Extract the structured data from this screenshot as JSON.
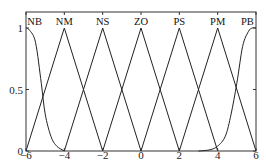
{
  "chart_data": {
    "type": "line",
    "title": "",
    "xlabel": "",
    "ylabel": "",
    "xlim": [
      -6,
      6
    ],
    "ylim": [
      0,
      1.1
    ],
    "x_ticks": [
      -6,
      -4,
      -2,
      0,
      2,
      4,
      6
    ],
    "x_tick_labels": [
      "−6",
      "−4",
      "−2",
      "0",
      "2",
      "4",
      "6"
    ],
    "y_ticks": [
      0,
      0.5,
      1
    ],
    "y_tick_labels": [
      "0",
      "0.5",
      "1"
    ],
    "grid": false,
    "legend": "none",
    "series": [
      {
        "name": "NB",
        "shape": "zmf",
        "params": [
          -6,
          -4
        ],
        "points": [
          [
            -6,
            1
          ],
          [
            -5.8,
            0.98
          ],
          [
            -5.5,
            0.88
          ],
          [
            -5.2,
            0.55
          ],
          [
            -5,
            0.3
          ],
          [
            -4.7,
            0.12
          ],
          [
            -4.4,
            0.04
          ],
          [
            -4,
            0
          ]
        ]
      },
      {
        "name": "NM",
        "shape": "trimf",
        "params": [
          -6,
          -4,
          -2
        ],
        "points": [
          [
            -6,
            0
          ],
          [
            -4,
            1
          ],
          [
            -2,
            0
          ]
        ]
      },
      {
        "name": "NS",
        "shape": "trimf",
        "params": [
          -4,
          -2,
          0
        ],
        "points": [
          [
            -4,
            0
          ],
          [
            -2,
            1
          ],
          [
            0,
            0
          ]
        ]
      },
      {
        "name": "ZO",
        "shape": "trimf",
        "params": [
          -2,
          0,
          2
        ],
        "points": [
          [
            -2,
            0
          ],
          [
            0,
            1
          ],
          [
            2,
            0
          ]
        ]
      },
      {
        "name": "PS",
        "shape": "trimf",
        "params": [
          0,
          2,
          4
        ],
        "points": [
          [
            0,
            0
          ],
          [
            2,
            1
          ],
          [
            4,
            0
          ]
        ]
      },
      {
        "name": "PM",
        "shape": "trimf",
        "params": [
          2,
          4,
          6
        ],
        "points": [
          [
            2,
            0
          ],
          [
            4,
            1
          ],
          [
            6,
            0
          ]
        ]
      },
      {
        "name": "PB",
        "shape": "smf",
        "params": [
          4,
          6
        ],
        "points": [
          [
            3,
            0
          ],
          [
            3.6,
            0.01
          ],
          [
            4,
            0.04
          ],
          [
            4.4,
            0.12
          ],
          [
            4.7,
            0.3
          ],
          [
            5,
            0.55
          ],
          [
            5.3,
            0.85
          ],
          [
            5.6,
            0.97
          ],
          [
            5.8,
            1
          ],
          [
            6,
            1
          ]
        ]
      }
    ],
    "annotations": [
      "NB",
      "NM",
      "NS",
      "ZO",
      "PS",
      "PM",
      "PB"
    ]
  }
}
